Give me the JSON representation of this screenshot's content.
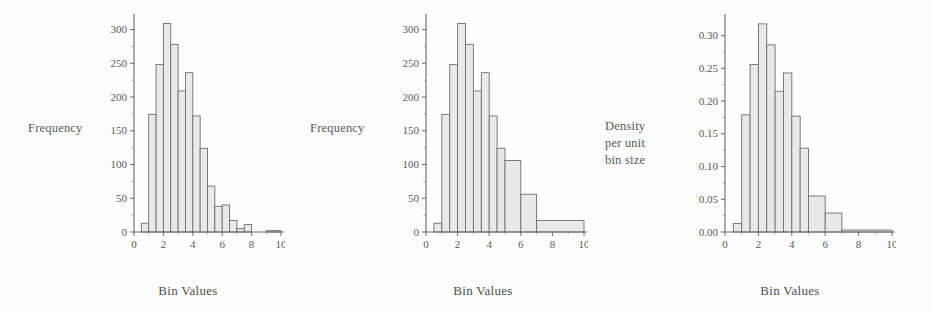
{
  "figure": {
    "background": "#fdfdfd",
    "bar_fill": "#e9e9e9",
    "bar_stroke": "#6f6f6f",
    "axis_color": "#6a6a6a",
    "text_color": "#58595b",
    "panel_count": 3
  },
  "chart_data": [
    {
      "type": "bar",
      "title": "",
      "subtitle": "",
      "xlabel": "Bin Values",
      "ylabel": "Frequency",
      "ylabel_lines": [
        "Frequency"
      ],
      "grid": false,
      "legend": "none",
      "xlim": [
        0,
        10
      ],
      "ylim": [
        0,
        320
      ],
      "xticks": [
        0,
        2,
        4,
        6,
        8,
        10
      ],
      "xtick_labels": [
        "0",
        "2",
        "4",
        "6",
        "8",
        "10"
      ],
      "x_minor_ticks": [
        1,
        3,
        5,
        7,
        9
      ],
      "yticks": [
        0,
        50,
        100,
        150,
        200,
        250,
        300
      ],
      "ytick_labels": [
        "0",
        "50",
        "100",
        "150",
        "200",
        "250",
        "300"
      ],
      "bin_edges": [
        0.5,
        1.0,
        1.5,
        2.0,
        2.5,
        3.0,
        3.5,
        4.0,
        4.5,
        5.0,
        5.5,
        6.0,
        6.5,
        7.0,
        7.5,
        8.0,
        8.5,
        9.0,
        9.5,
        10.0
      ],
      "values": [
        13,
        174,
        248,
        309,
        278,
        209,
        236,
        172,
        124,
        68,
        38,
        40,
        17,
        5,
        11,
        0,
        0,
        2,
        2
      ],
      "annotations": []
    },
    {
      "type": "bar",
      "title": "",
      "subtitle": "",
      "xlabel": "Bin Values",
      "ylabel": "Frequency",
      "ylabel_lines": [
        "Frequency"
      ],
      "grid": false,
      "legend": "none",
      "xlim": [
        0,
        10
      ],
      "ylim": [
        0,
        320
      ],
      "xticks": [
        0,
        2,
        4,
        6,
        8,
        10
      ],
      "xtick_labels": [
        "0",
        "2",
        "4",
        "6",
        "8",
        "10"
      ],
      "x_minor_ticks": [
        1,
        3,
        5,
        7,
        9
      ],
      "yticks": [
        0,
        50,
        100,
        150,
        200,
        250,
        300
      ],
      "ytick_labels": [
        "0",
        "50",
        "100",
        "150",
        "200",
        "250",
        "300"
      ],
      "bin_edges": [
        0.5,
        1.0,
        1.5,
        2.0,
        2.5,
        3.0,
        3.5,
        4.0,
        4.5,
        5.0,
        6.0,
        7.0,
        10.0
      ],
      "values": [
        13,
        174,
        248,
        309,
        278,
        209,
        236,
        172,
        124,
        106,
        56,
        17
      ],
      "annotations": []
    },
    {
      "type": "bar",
      "title": "",
      "subtitle": "",
      "xlabel": "Bin Values",
      "ylabel": "Density per unit bin size",
      "ylabel_lines": [
        "Density",
        "per unit",
        "bin size"
      ],
      "grid": false,
      "legend": "none",
      "xlim": [
        0,
        10
      ],
      "ylim": [
        0,
        0.33
      ],
      "xticks": [
        0,
        2,
        4,
        6,
        8,
        10
      ],
      "xtick_labels": [
        "0",
        "2",
        "4",
        "6",
        "8",
        "10"
      ],
      "x_minor_ticks": [
        1,
        3,
        5,
        7,
        9
      ],
      "yticks": [
        0.0,
        0.05,
        0.1,
        0.15,
        0.2,
        0.25,
        0.3
      ],
      "ytick_labels": [
        "0.00",
        "0.05",
        "0.10",
        "0.15",
        "0.20",
        "0.25",
        "0.30"
      ],
      "bin_edges": [
        0.5,
        1.0,
        1.5,
        2.0,
        2.5,
        3.0,
        3.5,
        4.0,
        4.5,
        5.0,
        6.0,
        7.0,
        10.0
      ],
      "values": [
        0.013,
        0.179,
        0.256,
        0.318,
        0.286,
        0.215,
        0.243,
        0.177,
        0.128,
        0.055,
        0.029,
        0.003
      ],
      "annotations": []
    }
  ]
}
